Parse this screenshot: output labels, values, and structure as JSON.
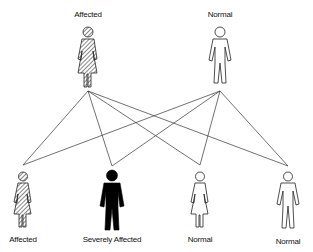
{
  "diagram": {
    "title": "",
    "parents": [
      {
        "id": "p1",
        "label": "Affected",
        "sex": "female",
        "status": "affected",
        "x": 88,
        "label_y": 10
      },
      {
        "id": "p2",
        "label": "Normal",
        "sex": "male",
        "status": "normal",
        "x": 220,
        "label_y": 10
      }
    ],
    "children": [
      {
        "id": "c1",
        "label": "Affected",
        "sex": "female",
        "status": "affected",
        "x": 23,
        "label_y": 235
      },
      {
        "id": "c2",
        "label": "Severely Affected",
        "sex": "male",
        "status": "severely-affected",
        "x": 112,
        "label_y": 235
      },
      {
        "id": "c3",
        "label": "Normal",
        "sex": "female",
        "status": "normal",
        "x": 200,
        "label_y": 235
      },
      {
        "id": "c4",
        "label": "Normal",
        "sex": "male",
        "status": "normal",
        "x": 288,
        "label_y": 237
      }
    ],
    "connections": [
      {
        "from": "p1",
        "to": "c1"
      },
      {
        "from": "p1",
        "to": "c2"
      },
      {
        "from": "p1",
        "to": "c3"
      },
      {
        "from": "p1",
        "to": "c4"
      },
      {
        "from": "p2",
        "to": "c1"
      },
      {
        "from": "p2",
        "to": "c2"
      },
      {
        "from": "p2",
        "to": "c3"
      },
      {
        "from": "p2",
        "to": "c4"
      }
    ],
    "colors": {
      "line": "#333333",
      "fill_severe": "#000000",
      "outline": "#222222"
    }
  }
}
